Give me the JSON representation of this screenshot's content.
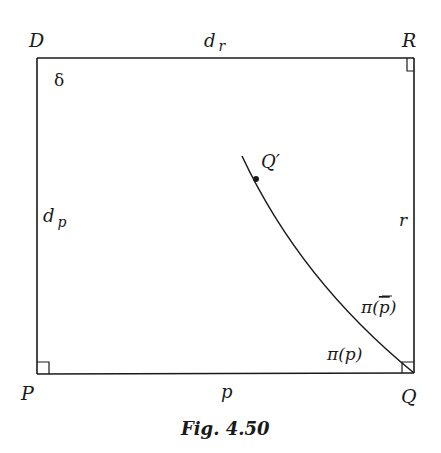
{
  "figure": {
    "caption": "Fig. 4.50",
    "vertices": {
      "D": "D",
      "R": "R",
      "Q": "Q",
      "P": "P",
      "Q_prime": "Q′"
    },
    "side_labels": {
      "top": {
        "main": "d",
        "sub": "r"
      },
      "left": {
        "main": "d",
        "sub": "p"
      },
      "right": "r",
      "bottom": "p"
    },
    "angle_labels": {
      "delta": "δ",
      "pi_p": "π(p)",
      "pi_pbar_prefix": "π(",
      "pi_pbar_var": "p",
      "pi_pbar_suffix": ")"
    },
    "right_angle_marks": [
      "R",
      "P",
      "Q"
    ],
    "stroke_color": "#1a1a1a"
  }
}
